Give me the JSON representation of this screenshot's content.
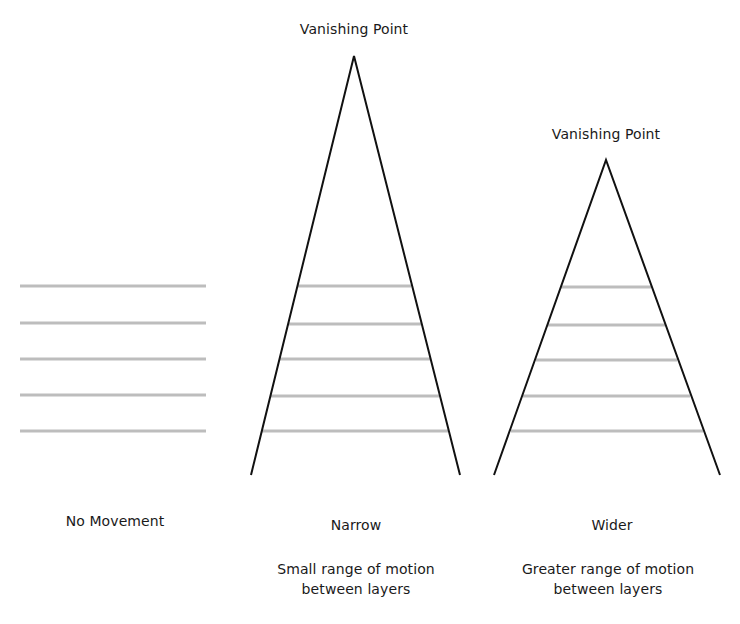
{
  "diagram": {
    "colors": {
      "triangle": "#111111",
      "layer": "#bdbdbd",
      "text": "#1a1a1a",
      "background": "#ffffff"
    },
    "panels": [
      {
        "id": "no-movement",
        "title": "No Movement",
        "title_pos": [
          115,
          512
        ],
        "vanishing_point": null,
        "layers": [
          {
            "x1": 20,
            "x2": 206,
            "y": 286
          },
          {
            "x1": 20,
            "x2": 206,
            "y": 323
          },
          {
            "x1": 20,
            "x2": 206,
            "y": 359
          },
          {
            "x1": 20,
            "x2": 206,
            "y": 395
          },
          {
            "x1": 20,
            "x2": 206,
            "y": 431
          }
        ]
      },
      {
        "id": "narrow",
        "title": "Narrow",
        "title_pos": [
          356,
          516
        ],
        "description_line1": "Small range of motion",
        "description_line2": "between layers",
        "desc_pos": [
          356,
          559
        ],
        "vanishing_point_label": "Vanishing Point",
        "vp_label_pos": [
          354,
          20
        ],
        "apex": [
          354,
          56
        ],
        "base_left": [
          251,
          475
        ],
        "base_right": [
          460,
          475
        ],
        "layers": [
          {
            "x1": 297,
            "x2": 411,
            "y": 286
          },
          {
            "x1": 288,
            "x2": 421,
            "y": 324
          },
          {
            "x1": 279,
            "x2": 430,
            "y": 359
          },
          {
            "x1": 270,
            "x2": 439,
            "y": 396
          },
          {
            "x1": 262,
            "x2": 448,
            "y": 431
          }
        ]
      },
      {
        "id": "wider",
        "title": "Wider",
        "title_pos": [
          612,
          516
        ],
        "description_line1": "Greater range of motion",
        "description_line2": "between layers",
        "desc_pos": [
          608,
          559
        ],
        "vanishing_point_label": "Vanishing Point",
        "vp_label_pos": [
          606,
          125
        ],
        "apex": [
          606,
          160
        ],
        "base_left": [
          494,
          475
        ],
        "base_right": [
          720,
          475
        ],
        "layers": [
          {
            "x1": 561,
            "x2": 651,
            "y": 287
          },
          {
            "x1": 548,
            "x2": 665,
            "y": 325
          },
          {
            "x1": 536,
            "x2": 677,
            "y": 360
          },
          {
            "x1": 523,
            "x2": 690,
            "y": 396
          },
          {
            "x1": 511,
            "x2": 703,
            "y": 431
          }
        ]
      }
    ]
  }
}
